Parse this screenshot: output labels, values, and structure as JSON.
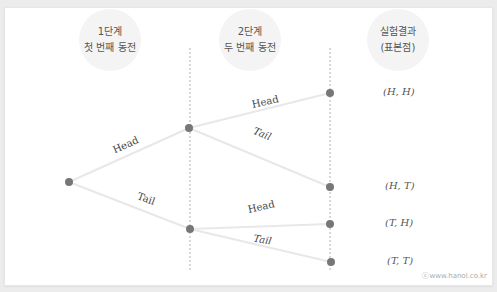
{
  "stages": [
    {
      "line1": "1단계",
      "line2": "첫 번째 동전"
    },
    {
      "line1": "2단계",
      "line2": "두 번째 동전"
    },
    {
      "line1": "실험결과",
      "line2": "(표본점)"
    }
  ],
  "branches": {
    "first_head": "Head",
    "first_tail": "Tail",
    "second_head_upper": "Head",
    "second_tail_upper": "Tail",
    "second_head_lower": "Head",
    "second_tail_lower": "Tail"
  },
  "outcomes": [
    "(H, H)",
    "(H, T)",
    "(T, H)",
    "(T, T)"
  ],
  "watermark": "ⓒwww.hanol.co.kr",
  "colors": {
    "node": "#777777",
    "edge": "#e8e8e8",
    "divider": "#b0b0b0",
    "bubble": "#f4f4f4"
  }
}
